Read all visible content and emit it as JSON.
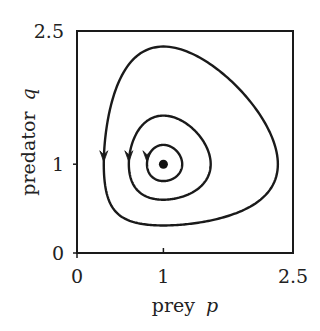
{
  "chart_data": {
    "type": "line",
    "title": "",
    "subtitle": "",
    "xlabel": "prey",
    "xlabel_var": "p",
    "ylabel": "predator",
    "ylabel_var": "q",
    "xlim": [
      0,
      2.5
    ],
    "ylim": [
      0,
      2.5
    ],
    "xticks": [
      0,
      1,
      2.5
    ],
    "xtick_labels": [
      "0",
      "1",
      "2.5"
    ],
    "yticks": [
      0,
      1,
      2.5
    ],
    "ytick_labels": [
      "0",
      "1",
      "2.5"
    ],
    "grid": false,
    "legend": null,
    "equilibrium": {
      "p": 1,
      "q": 1
    },
    "series": [
      {
        "name": "outer orbit",
        "p_min": 0.31,
        "p_max": 2.31,
        "q_min": 0.32,
        "q_max": 2.28,
        "arrow_at": {
          "p": 0.31,
          "q": 1.05
        },
        "direction": "counterclockwise"
      },
      {
        "name": "middle orbit",
        "p_min": 0.6,
        "p_max": 1.55,
        "q_min": 0.6,
        "q_max": 1.55,
        "arrow_at": {
          "p": 0.6,
          "q": 1.05
        },
        "direction": "counterclockwise"
      },
      {
        "name": "inner orbit",
        "p_min": 0.81,
        "p_max": 1.21,
        "q_min": 0.81,
        "q_max": 1.21,
        "arrow_at": {
          "p": 0.81,
          "q": 1.05
        },
        "direction": "counterclockwise"
      }
    ]
  },
  "labels": {
    "x_tick_0": "0",
    "x_tick_1": "1",
    "x_tick_2": "2.5",
    "y_tick_0": "0",
    "y_tick_1": "1",
    "y_tick_2": "2.5",
    "x_axis_word": "prey",
    "x_axis_var": "p",
    "y_axis_word": "predator",
    "y_axis_var": "q"
  },
  "style": {
    "line_color": "#1a1a1a",
    "frame_color": "#1a1a1a",
    "background": "#ffffff"
  }
}
